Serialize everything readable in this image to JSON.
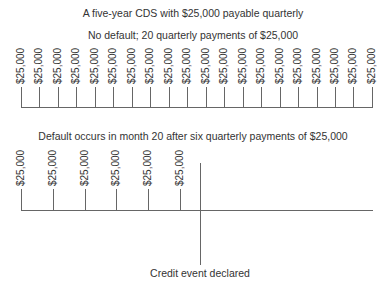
{
  "header": {
    "title": "A five-year CDS with $25,000 payable quarterly"
  },
  "no_default": {
    "caption": "No default; 20 quarterly payments of $25,000",
    "payment_label": "$25,000",
    "payment_count": 20,
    "payments": [
      "$25,000",
      "$25,000",
      "$25,000",
      "$25,000",
      "$25,000",
      "$25,000",
      "$25,000",
      "$25,000",
      "$25,000",
      "$25,000",
      "$25,000",
      "$25,000",
      "$25,000",
      "$25,000",
      "$25,000",
      "$25,000",
      "$25,000",
      "$25,000",
      "$25,000",
      "$25,000"
    ]
  },
  "default": {
    "caption": "Default occurs in month 20 after six quarterly payments of $25,000",
    "payment_label": "$25,000",
    "payment_count": 6,
    "payments": [
      "$25,000",
      "$25,000",
      "$25,000",
      "$25,000",
      "$25,000",
      "$25,000"
    ],
    "event_label": "Credit event declared"
  },
  "colors": {
    "line": "#666666",
    "text": "#333333"
  }
}
